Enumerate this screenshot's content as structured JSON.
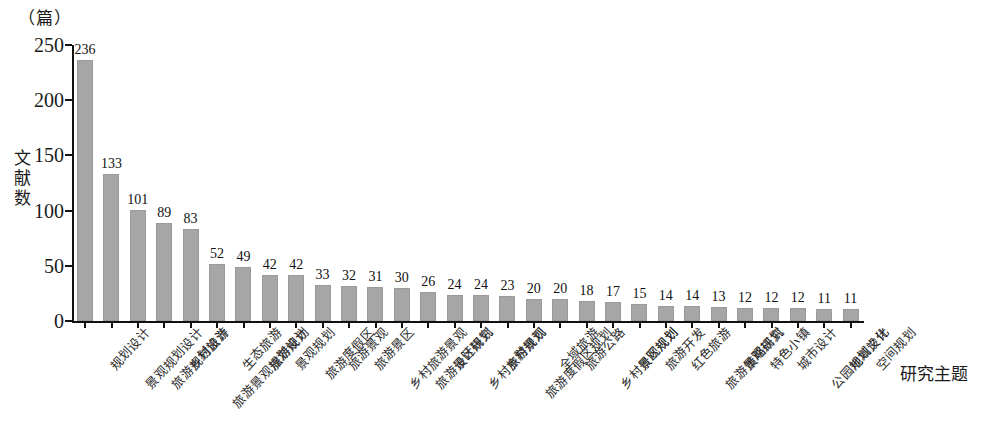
{
  "chart_data": {
    "type": "bar",
    "title": "",
    "unit_label": "（篇）",
    "xlabel": "研究主题",
    "ylabel": "文献数",
    "ylim": [
      0,
      250
    ],
    "yticks": [
      0,
      50,
      100,
      150,
      200,
      250
    ],
    "grid": false,
    "legend": null,
    "bar_color": "#a6a6a6",
    "axis_color": "#111111",
    "background_color": "#ffffff",
    "categories": [
      "规划设计",
      "景观规划设计",
      "旅游规划设计",
      "乡村旅游",
      "旅游景观规划设计",
      "生态旅游",
      "旅游规划",
      "景观规划",
      "旅游度假区",
      "旅游景观",
      "旅游景区",
      "乡村旅游景观",
      "旅游景区规划",
      "设计研究",
      "乡村旅游规划",
      "乡村景观",
      "旅游度假区规划",
      "全域旅游",
      "旅游公路",
      "乡村景观规划",
      "景区规划",
      "旅游开发",
      "红色旅游",
      "旅游景观规划",
      "策略研究",
      "特色小镇",
      "城市设计",
      "公园规划设计",
      "地域文化",
      "空间规划"
    ],
    "values": [
      236,
      133,
      101,
      89,
      83,
      52,
      49,
      42,
      42,
      33,
      32,
      31,
      30,
      26,
      24,
      24,
      23,
      20,
      20,
      18,
      17,
      15,
      14,
      14,
      13,
      12,
      12,
      12,
      11,
      11
    ]
  }
}
